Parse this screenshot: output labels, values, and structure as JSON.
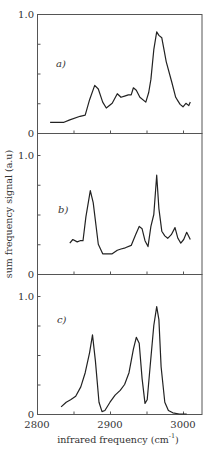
{
  "chart_data": {
    "type": "line",
    "layout": "three vertically stacked panels sharing x-axis",
    "xlabel": "infrared frequency (cm",
    "xlabel_superscript": "-1",
    "xlabel_suffix": ")",
    "ylabel": "sum frequency signal (a.u)",
    "xlim": [
      2800,
      3026
    ],
    "x_ticks": [
      2800,
      2850,
      2900,
      2950,
      3000
    ],
    "x_tick_labels": [
      "2800",
      "2900",
      "3000"
    ],
    "y_ticks": [
      0,
      0.25,
      0.5,
      0.75,
      1.0
    ],
    "y_tick_labels": [
      "0",
      "1.0"
    ],
    "ylim": [
      0,
      1.0
    ],
    "grid": false,
    "legend": null,
    "panels": [
      {
        "label": "a)",
        "x": [
          2818,
          2831,
          2837,
          2845,
          2859,
          2866,
          2872,
          2879,
          2884,
          2890,
          2895,
          2903,
          2910,
          2915,
          2920,
          2925,
          2929,
          2932,
          2936,
          2941,
          2949,
          2953,
          2956,
          2960,
          2964,
          2967,
          2971,
          2974,
          2977,
          2985,
          2990,
          2993,
          2996,
          3000,
          3004,
          3008,
          3010
        ],
        "y": [
          0.09,
          0.09,
          0.09,
          0.11,
          0.14,
          0.15,
          0.28,
          0.4,
          0.37,
          0.26,
          0.21,
          0.25,
          0.33,
          0.3,
          0.31,
          0.32,
          0.32,
          0.38,
          0.36,
          0.3,
          0.26,
          0.34,
          0.45,
          0.7,
          0.85,
          0.82,
          0.8,
          0.7,
          0.6,
          0.42,
          0.3,
          0.27,
          0.24,
          0.22,
          0.25,
          0.23,
          0.26
        ]
      },
      {
        "label": "b)",
        "x": [
          2845,
          2849,
          2855,
          2859,
          2863,
          2867,
          2873,
          2877,
          2884,
          2890,
          2897,
          2903,
          2910,
          2915,
          2921,
          2929,
          2935,
          2940,
          2944,
          2948,
          2952,
          2956,
          2960,
          2964,
          2967,
          2971,
          2975,
          2979,
          2984,
          2989,
          2993,
          2997,
          3001,
          3005,
          3010
        ],
        "y": [
          0.26,
          0.29,
          0.27,
          0.28,
          0.28,
          0.48,
          0.7,
          0.6,
          0.25,
          0.17,
          0.17,
          0.17,
          0.2,
          0.21,
          0.22,
          0.24,
          0.33,
          0.4,
          0.38,
          0.28,
          0.23,
          0.4,
          0.5,
          0.83,
          0.55,
          0.36,
          0.32,
          0.3,
          0.33,
          0.39,
          0.3,
          0.26,
          0.29,
          0.35,
          0.29
        ]
      },
      {
        "label": "c)",
        "x": [
          2833,
          2840,
          2846,
          2853,
          2860,
          2866,
          2872,
          2876,
          2880,
          2885,
          2889,
          2893,
          2900,
          2907,
          2914,
          2920,
          2926,
          2932,
          2936,
          2940,
          2944,
          2948,
          2951,
          2955,
          2960,
          2964,
          2967,
          2970,
          2975,
          2980,
          2986,
          2995,
          3005
        ],
        "y": [
          0.06,
          0.1,
          0.12,
          0.15,
          0.23,
          0.35,
          0.52,
          0.67,
          0.45,
          0.1,
          0.02,
          0.03,
          0.1,
          0.16,
          0.2,
          0.25,
          0.35,
          0.55,
          0.65,
          0.6,
          0.3,
          0.09,
          0.12,
          0.4,
          0.75,
          0.91,
          0.8,
          0.4,
          0.1,
          0.03,
          0.01,
          0.0,
          0.0
        ]
      }
    ]
  },
  "panels_geometry_note": "three boxed panels",
  "labels": {
    "panel_a": "a)",
    "panel_b": "b)",
    "panel_c": "c)",
    "y_one": "1.0",
    "y_zero": "0",
    "x_2800": "2800",
    "x_2900": "2900",
    "x_3000": "3000",
    "xlabel": "infrared frequency (cm",
    "xlabel_sup": "-1",
    "xlabel_close": ")",
    "ylabel": "sum frequency signal (a.u)"
  }
}
